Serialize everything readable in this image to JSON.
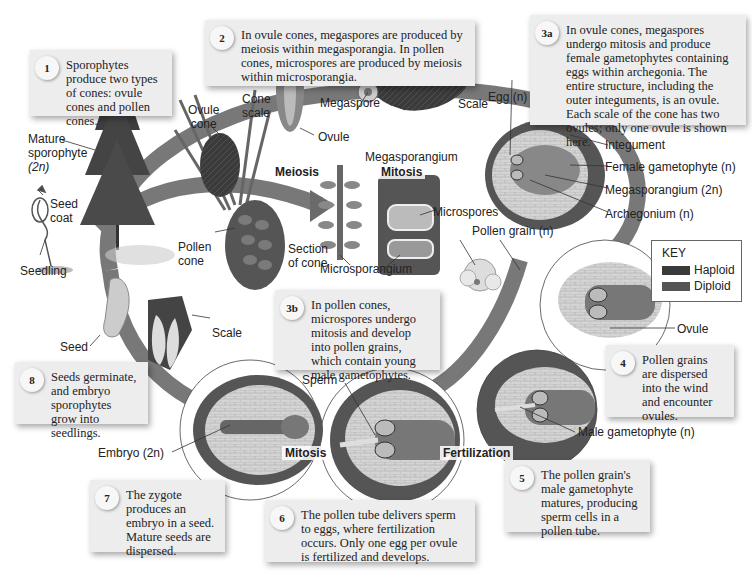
{
  "colors": {
    "background": "#ffffff",
    "callout_box": "#ededed",
    "haploid": "#3a3a3a",
    "diploid": "#555555",
    "cycle_arrow": "#6a6a6a"
  },
  "steps": [
    {
      "num": "1",
      "text": "Sporophytes produce two types of cones: ovule cones and pollen cones."
    },
    {
      "num": "2",
      "text": "In ovule cones, megaspores are produced by meiosis within megasporangia. In pollen cones, microspores are produced by meiosis within microsporangia."
    },
    {
      "num": "3a",
      "text": "In ovule cones, megaspores undergo mitosis and produce female gametophytes containing eggs within archegonia. The entire structure, including the outer integuments, is an ovule. Each scale of the cone has two ovules; only one ovule is shown here."
    },
    {
      "num": "3b",
      "text": "In pollen cones, microspores undergo mitosis and develop into pollen grains, which contain young male gametophytes."
    },
    {
      "num": "4",
      "text": "Pollen grains are dispersed into the wind and encounter ovules."
    },
    {
      "num": "5",
      "text": "The pollen grain's male gametophyte matures, producing sperm cells in a pollen tube."
    },
    {
      "num": "6",
      "text": "The pollen tube delivers sperm to eggs, where fertilization occurs. Only one egg per ovule is fertilized and develops."
    },
    {
      "num": "7",
      "text": "The zygote produces an embryo in a seed. Mature seeds are dispersed."
    },
    {
      "num": "8",
      "text": "Seeds germinate, and embryo sporophytes grow into seedlings."
    }
  ],
  "labels": {
    "mature_sporophyte": "Mature sporophyte (2n)",
    "mature_sporophyte_l1": "Mature",
    "mature_sporophyte_l2": "sporophyte",
    "mature_sporophyte_l3": "(2n)",
    "ovule_cone_l1": "Ovule",
    "ovule_cone_l2": "cone",
    "cone_scale_l1": "Cone",
    "cone_scale_l2": "scale",
    "ovule_top": "Ovule",
    "megaspore": "Megaspore",
    "scale_top": "Scale",
    "megasporangium": "Megasporangium",
    "egg": "Egg (n)",
    "integument": "Integument",
    "female_gametophyte": "Female gametophyte (n)",
    "megasporangium_2n": "Megasporangium (2n)",
    "archegonium": "Archegonium (n)",
    "microspores": "Microspores",
    "pollen_grain": "Pollen grain (n)",
    "section_of_cone_l1": "Section",
    "section_of_cone_l2": "of cone",
    "microsporangium": "Microsporangium",
    "pollen_cone_l1": "Pollen",
    "pollen_cone_l2": "cone",
    "seed_coat_l1": "Seed",
    "seed_coat_l2": "coat",
    "seedling": "Seedling",
    "seed": "Seed",
    "scale_bottom": "Scale",
    "ovule_right": "Ovule",
    "sperm": "Sperm",
    "embryo": "Embryo (2n)",
    "male_gametophyte": "Male gametophyte (n)"
  },
  "stage_labels": {
    "meiosis": "Meiosis",
    "mitosis_top": "Mitosis",
    "mitosis_bottom": "Mitosis",
    "fertilization": "Fertilization"
  },
  "key": {
    "title": "KEY",
    "items": [
      {
        "label": "Haploid",
        "color": "#3a3a3a"
      },
      {
        "label": "Diploid",
        "color": "#555555"
      }
    ]
  }
}
